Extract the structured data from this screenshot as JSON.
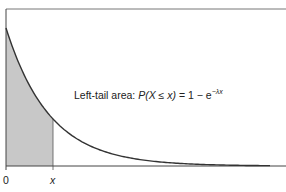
{
  "chart_data": {
    "type": "area",
    "title": "",
    "distribution": "exponential",
    "annotation": {
      "prefix": "Left-tail area: ",
      "expr_lhs": "P(X ≤ x)",
      "eq": " = 1 − e",
      "exponent": "−λx"
    },
    "x_ticks": [
      "0",
      "x"
    ],
    "shaded_region": {
      "from": "0",
      "to": "x",
      "label": "left tail"
    },
    "curve": "f(x) = λe^(−λx)",
    "xlabel": "",
    "ylabel": "",
    "grid": false,
    "legend": null
  },
  "colors": {
    "curve": "#333333",
    "shade": "#c8c8c8",
    "axis": "#444444"
  }
}
